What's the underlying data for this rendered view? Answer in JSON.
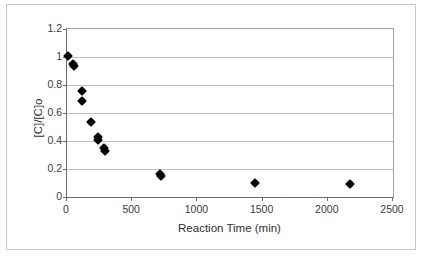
{
  "chart_data": {
    "type": "scatter",
    "title": "",
    "xlabel": "Reaction Time (min)",
    "ylabel": "[C]/[C]o",
    "xlim": [
      0,
      2500
    ],
    "ylim": [
      0,
      1.2
    ],
    "xticks": [
      0,
      500,
      1000,
      1500,
      2000,
      2500
    ],
    "xtick_labels": [
      "0",
      "500",
      "1000",
      "1500",
      "2000",
      "2500"
    ],
    "yticks": [
      0,
      0.2,
      0.4,
      0.6,
      0.8,
      1,
      1.2
    ],
    "ytick_labels": [
      "0",
      "0.2",
      "0.4",
      "0.6",
      "0.8",
      "1",
      "1.2"
    ],
    "grid": "horizontal",
    "legend": null,
    "marker_style": "filled-diamond",
    "marker_color": "#000000",
    "series": [
      {
        "name": "series-1",
        "points": [
          {
            "x": 15,
            "y": 1.0
          },
          {
            "x": 50,
            "y": 0.94
          },
          {
            "x": 58,
            "y": 0.93
          },
          {
            "x": 125,
            "y": 0.75
          },
          {
            "x": 125,
            "y": 0.68
          },
          {
            "x": 190,
            "y": 0.53
          },
          {
            "x": 243,
            "y": 0.42
          },
          {
            "x": 245,
            "y": 0.4
          },
          {
            "x": 293,
            "y": 0.34
          },
          {
            "x": 300,
            "y": 0.32
          },
          {
            "x": 723,
            "y": 0.16
          },
          {
            "x": 730,
            "y": 0.145
          },
          {
            "x": 1450,
            "y": 0.09
          },
          {
            "x": 2175,
            "y": 0.085
          }
        ]
      }
    ]
  },
  "colors": {
    "plot_border": "#6b6b6b",
    "gridline": "#c0c0c0",
    "outer_border": "#c9c9c9",
    "axis_text": "#3a3a3a",
    "title_text": "#2f2f2f",
    "background": "#ffffff"
  }
}
